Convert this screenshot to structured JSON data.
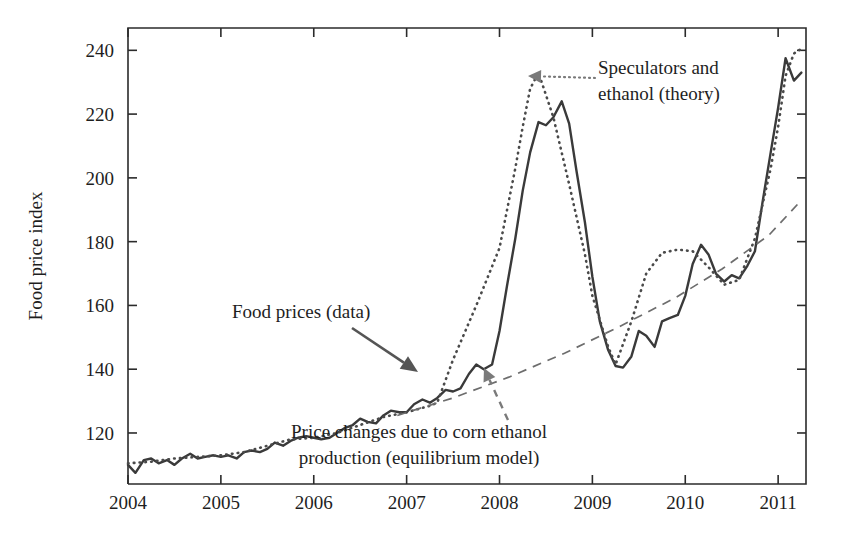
{
  "chart_data": {
    "type": "line",
    "title": "",
    "xlabel": "",
    "ylabel": "Food price index",
    "xlim": [
      2004.0,
      2011.3
    ],
    "ylim": [
      104,
      247
    ],
    "xticks": [
      "2004",
      "2005",
      "2006",
      "2007",
      "2008",
      "2009",
      "2010",
      "2011"
    ],
    "xtick_values": [
      2004,
      2005,
      2006,
      2007,
      2008,
      2009,
      2010,
      2011
    ],
    "yticks": [
      "120",
      "140",
      "160",
      "180",
      "200",
      "220",
      "240"
    ],
    "ytick_values": [
      120,
      140,
      160,
      180,
      200,
      220,
      240
    ],
    "grid": false,
    "legend_position": "none",
    "series": [
      {
        "name": "Food prices (data)",
        "style": "solid",
        "x": [
          2004.0,
          2004.08,
          2004.17,
          2004.25,
          2004.33,
          2004.42,
          2004.5,
          2004.58,
          2004.67,
          2004.75,
          2004.83,
          2004.92,
          2005.0,
          2005.08,
          2005.17,
          2005.25,
          2005.33,
          2005.42,
          2005.5,
          2005.58,
          2005.67,
          2005.75,
          2005.83,
          2005.92,
          2006.0,
          2006.08,
          2006.17,
          2006.25,
          2006.33,
          2006.42,
          2006.5,
          2006.58,
          2006.67,
          2006.75,
          2006.83,
          2006.92,
          2007.0,
          2007.08,
          2007.17,
          2007.25,
          2007.33,
          2007.42,
          2007.5,
          2007.58,
          2007.67,
          2007.75,
          2007.83,
          2007.92,
          2008.0,
          2008.08,
          2008.17,
          2008.25,
          2008.33,
          2008.42,
          2008.5,
          2008.58,
          2008.67,
          2008.75,
          2008.83,
          2008.92,
          2009.0,
          2009.08,
          2009.17,
          2009.25,
          2009.33,
          2009.42,
          2009.5,
          2009.58,
          2009.67,
          2009.75,
          2009.83,
          2009.92,
          2010.0,
          2010.08,
          2010.17,
          2010.25,
          2010.33,
          2010.42,
          2010.5,
          2010.58,
          2010.67,
          2010.75,
          2010.83,
          2010.92,
          2011.0,
          2011.08,
          2011.17,
          2011.25
        ],
        "y": [
          110.0,
          107.5,
          111.5,
          112.0,
          110.5,
          111.5,
          110.0,
          112.0,
          113.5,
          112.0,
          112.5,
          113.0,
          112.5,
          113.0,
          112.0,
          114.0,
          114.5,
          114.0,
          115.0,
          117.0,
          116.0,
          117.5,
          118.5,
          119.0,
          118.5,
          118.0,
          118.5,
          120.0,
          121.5,
          122.5,
          124.5,
          123.5,
          123.0,
          125.5,
          127.0,
          126.5,
          126.5,
          129.0,
          130.5,
          129.5,
          131.0,
          133.5,
          133.0,
          134.0,
          138.5,
          141.5,
          140.0,
          141.5,
          152.0,
          166.0,
          181.0,
          196.0,
          208.0,
          217.5,
          216.5,
          219.0,
          224.0,
          217.0,
          202.0,
          186.0,
          169.0,
          155.0,
          146.0,
          141.0,
          140.5,
          144.0,
          152.0,
          150.5,
          147.0,
          155.0,
          156.0,
          157.0,
          163.0,
          173.0,
          179.0,
          176.0,
          170.0,
          167.5,
          169.5,
          168.5,
          172.5,
          177.0,
          192.0,
          208.0,
          222.0,
          237.5,
          230.5,
          233.0
        ]
      },
      {
        "name": "Speculators and ethanol (theory)",
        "style": "dotted",
        "x": [
          2004.0,
          2004.25,
          2004.5,
          2004.75,
          2005.0,
          2005.25,
          2005.5,
          2005.75,
          2006.0,
          2006.25,
          2006.5,
          2006.75,
          2007.0,
          2007.25,
          2007.33,
          2007.5,
          2007.75,
          2008.0,
          2008.17,
          2008.25,
          2008.33,
          2008.42,
          2008.58,
          2008.75,
          2008.92,
          2009.0,
          2009.17,
          2009.25,
          2009.42,
          2009.58,
          2009.75,
          2009.92,
          2010.08,
          2010.25,
          2010.42,
          2010.58,
          2010.75,
          2010.92,
          2011.0,
          2011.08,
          2011.17,
          2011.25
        ],
        "y": [
          110.5,
          111.0,
          112.0,
          112.5,
          113.0,
          114.0,
          116.0,
          118.0,
          118.5,
          120.0,
          122.5,
          125.0,
          126.5,
          128.5,
          129.5,
          143.0,
          160.0,
          178.0,
          203.0,
          216.0,
          228.0,
          233.0,
          219.0,
          198.0,
          176.0,
          163.0,
          147.0,
          141.5,
          155.0,
          170.0,
          176.5,
          177.5,
          177.0,
          172.0,
          166.5,
          168.0,
          181.0,
          203.0,
          216.0,
          232.0,
          239.0,
          240.5
        ]
      },
      {
        "name": "Price changes due to corn ethanol production (equilibrium model)",
        "style": "dashed",
        "x": [
          2006.9,
          2007.5,
          2008.1,
          2008.7,
          2009.3,
          2009.9,
          2010.4,
          2010.9,
          2011.25
        ],
        "y": [
          125.5,
          131.0,
          137.5,
          145.0,
          153.5,
          162.5,
          171.5,
          182.0,
          193.0
        ]
      }
    ],
    "annotations": [
      {
        "name": "speculators-ethanol",
        "lines": [
          "Speculators and",
          "ethanol (theory)"
        ],
        "text_x": 598,
        "text_y": 74,
        "leader": "dotted",
        "leader_from": [
          595,
          78
        ],
        "leader_to": [
          528,
          76
        ]
      },
      {
        "name": "food-prices-data",
        "lines": [
          "Food prices (data)"
        ],
        "text_x": 232,
        "text_y": 318,
        "leader": "solid",
        "leader_from": [
          352,
          328
        ],
        "leader_to": [
          418,
          372
        ]
      },
      {
        "name": "corn-ethanol-equilibrium",
        "lines": [
          "Price changes due to corn ethanol",
          "production (equilibrium model)"
        ],
        "text_x": 419,
        "text_y": 438,
        "leader": "dashed",
        "leader_from": [
          508,
          420
        ],
        "leader_to": [
          484,
          368
        ]
      }
    ],
    "colors": {
      "data_line": "#3a3a3a",
      "theory_line": "#4a4a4a",
      "equilibrium_line": "#6d6d6d",
      "axis": "#2b2b2b",
      "text": "#1e1e1e",
      "background": "#ffffff"
    },
    "plot_box": {
      "left": 128,
      "right": 806,
      "top": 28,
      "bottom": 484
    }
  }
}
